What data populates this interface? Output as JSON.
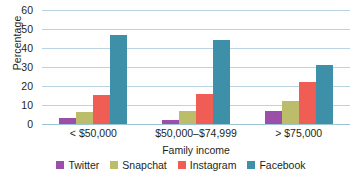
{
  "chart_data": {
    "type": "bar",
    "title": "",
    "xlabel": "Family income",
    "ylabel": "Percentage",
    "categories": [
      "< $50,000",
      "$50,000–$74,999",
      "> $75,000"
    ],
    "series": [
      {
        "name": "Twitter",
        "color": "#9b4fa8",
        "values": [
          3,
          2,
          7
        ]
      },
      {
        "name": "Snapchat",
        "color": "#bcbd6a",
        "values": [
          6.5,
          7,
          12
        ]
      },
      {
        "name": "Instagram",
        "color": "#ef5d54",
        "values": [
          15.5,
          16,
          22
        ]
      },
      {
        "name": "Facebook",
        "color": "#3d90a7",
        "values": [
          47,
          44,
          31
        ]
      }
    ],
    "ylim": [
      0,
      60
    ],
    "ytick_labels": [
      "60",
      "50",
      "40",
      "30",
      "20",
      "10",
      "0"
    ],
    "ytick_values": [
      60,
      50,
      40,
      30,
      20,
      10,
      0
    ],
    "grid": true,
    "legend_position": "bottom"
  },
  "caption": {
    "text": ""
  }
}
